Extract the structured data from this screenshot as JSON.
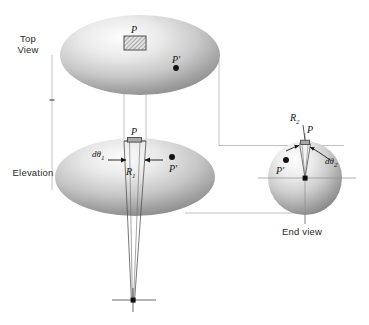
{
  "figure": {
    "type": "geometric-optics-projection-diagram",
    "background": "#ffffff",
    "ink_color": "#1a1a1a",
    "construction_line_color": "#9a9a9a"
  },
  "views": {
    "top": {
      "label": "Top\nView",
      "label_x": 22,
      "label_y": 38,
      "ellipse": {
        "cx": 140,
        "cy": 55,
        "rx": 80,
        "ry": 40
      },
      "patch_label": "P",
      "point_label": "P′"
    },
    "elevation": {
      "label": "Elevation",
      "label_x": 8,
      "label_y": 172,
      "ellipse": {
        "cx": 135,
        "cy": 177,
        "rx": 80,
        "ry": 39
      },
      "patch_label": "P",
      "point_label": "P′",
      "angle_label": "dθ",
      "angle_sub": "1",
      "radius_label": "R",
      "radius_sub": "1"
    },
    "end": {
      "label": "End view",
      "label_x": 281,
      "label_y": 231,
      "circle": {
        "cx": 305,
        "cy": 178,
        "r": 37
      },
      "patch_label": "P",
      "point_label": "P′",
      "angle_label": "dθ",
      "angle_sub": "2",
      "radius_label": "R",
      "radius_sub": "2"
    }
  },
  "annotations": {
    "center_of_curvature_1": {
      "x": 133,
      "y": 300
    },
    "center_of_curvature_2": {
      "x": 305,
      "y": 205
    }
  }
}
